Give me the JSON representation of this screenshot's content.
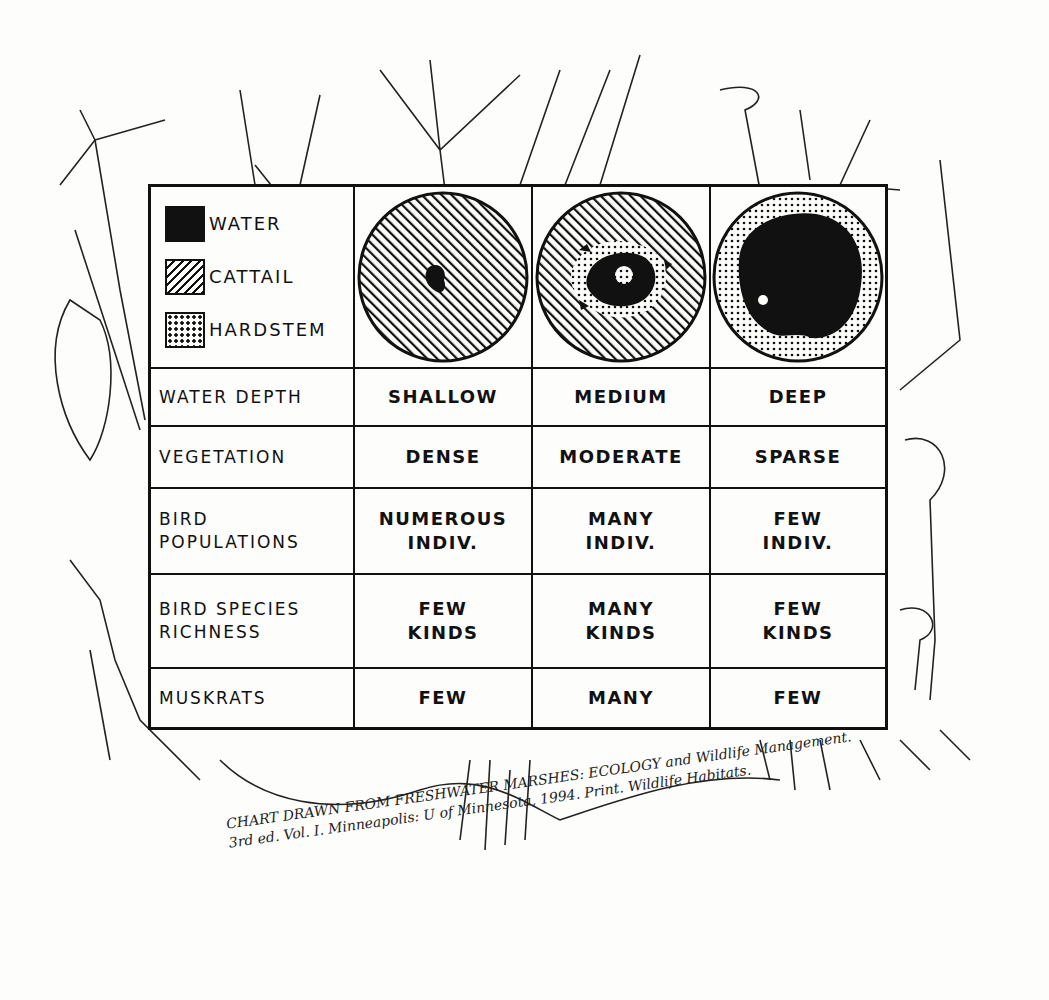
{
  "legend": {
    "items": [
      {
        "label": "WATER",
        "pattern": "solid-black"
      },
      {
        "label": "CATTAIL",
        "pattern": "diagonal-hatch"
      },
      {
        "label": "HARDSTEM",
        "pattern": "dots"
      }
    ]
  },
  "columns": [
    {
      "depth": "SHALLOW",
      "circle": "mostly cattail with a small water patch"
    },
    {
      "depth": "MEDIUM",
      "circle": "mixed cattail, hardstem and water patches"
    },
    {
      "depth": "DEEP",
      "circle": "mostly open water ringed by hardstem"
    }
  ],
  "rows": [
    {
      "label": "WATER DEPTH",
      "values": [
        "SHALLOW",
        "MEDIUM",
        "DEEP"
      ]
    },
    {
      "label": "VEGETATION",
      "values": [
        "DENSE",
        "MODERATE",
        "SPARSE"
      ]
    },
    {
      "label": "BIRD\nPOPULATIONS",
      "values": [
        "NUMEROUS\nINDIV.",
        "MANY\nINDIV.",
        "FEW\nINDIV."
      ]
    },
    {
      "label": "BIRD SPECIES\nRICHNESS",
      "values": [
        "FEW\nKINDS",
        "MANY\nKINDS",
        "FEW\nKINDS"
      ]
    },
    {
      "label": "MUSKRATS",
      "values": [
        "FEW",
        "MANY",
        "FEW"
      ]
    }
  ],
  "citation": {
    "line1": "CHART DRAWN FROM FRESHWATER MARSHES: ECOLOGY and Wildlife Management.",
    "line2": "3rd ed. Vol. I. Minneapolis: U of Minnesota, 1994. Print. Wildlife Habitats."
  }
}
